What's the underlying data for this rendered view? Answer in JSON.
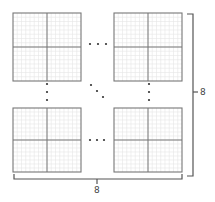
{
  "diagram": {
    "blocks_shown": [
      {
        "position": "top-left",
        "x": 13,
        "y": 13,
        "size": 68
      },
      {
        "position": "top-right",
        "x": 114,
        "y": 13,
        "size": 68
      },
      {
        "position": "bottom-left",
        "x": 13,
        "y": 108,
        "size": 64
      },
      {
        "position": "bottom-right",
        "x": 114,
        "y": 108,
        "size": 64
      }
    ],
    "fine_subdivisions_per_block": 16,
    "ellipses": [
      "horizontal-top",
      "horizontal-bottom",
      "vertical-left",
      "vertical-right",
      "diagonal-center"
    ],
    "right_brace_label": "8",
    "bottom_brace_label": "8"
  },
  "colors": {
    "outline": "#777777",
    "fine_grid": "#e6e6e6",
    "dots": "#333333",
    "brace": "#555555"
  }
}
